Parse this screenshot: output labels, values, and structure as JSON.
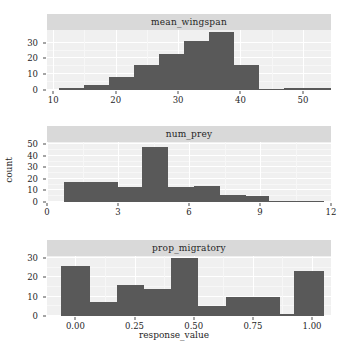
{
  "figure": {
    "xlabel": "response_value",
    "ylabel": "count",
    "bar_color": "#595959",
    "panel_background": "#f0f0f0",
    "strip_background": "#d9d9d9",
    "grid_color": "#ffffff"
  },
  "chart_data": [
    {
      "type": "bar",
      "title": "mean_wingspan",
      "xlabel": "",
      "ylabel": "count",
      "xlim": [
        9.0,
        54.5
      ],
      "ylim": [
        0,
        38
      ],
      "xticks": [
        10,
        20,
        30,
        40,
        50
      ],
      "xticklabels": [
        "10",
        "20",
        "30",
        "40",
        "50"
      ],
      "yticks": [
        0,
        10,
        20,
        30
      ],
      "yticklabels": [
        "0",
        "10",
        "20",
        "30"
      ],
      "grid": true,
      "bin_edges": [
        11.0,
        15.0,
        19.0,
        23.0,
        27.0,
        31.0,
        35.0,
        39.0,
        43.0,
        47.0,
        51.0,
        54.5
      ],
      "values": [
        1,
        3,
        8,
        16,
        23,
        31,
        37,
        16,
        0,
        1,
        1
      ]
    },
    {
      "type": "bar",
      "title": "num_prey",
      "xlabel": "",
      "ylabel": "count",
      "xlim": [
        0,
        12
      ],
      "ylim": [
        0,
        52
      ],
      "xticks": [
        0,
        3,
        6,
        9,
        12
      ],
      "xticklabels": [
        "0",
        "3",
        "6",
        "9",
        "12"
      ],
      "yticks": [
        0,
        10,
        20,
        30,
        40,
        50
      ],
      "yticklabels": [
        "0",
        "10",
        "20",
        "30",
        "40",
        "50"
      ],
      "grid": true,
      "bin_edges": [
        0.7,
        1.85,
        3.0,
        4.0,
        5.1,
        6.2,
        7.3,
        8.4,
        9.4,
        11.7
      ],
      "values": [
        17,
        17,
        13,
        48,
        13,
        14,
        6,
        5,
        1
      ]
    },
    {
      "type": "bar",
      "title": "prop_migratory",
      "xlabel": "response_value",
      "ylabel": "count",
      "xlim": [
        -0.12,
        1.08
      ],
      "ylim": [
        0,
        31
      ],
      "xticks": [
        0.0,
        0.25,
        0.5,
        0.75,
        1.0
      ],
      "xticklabels": [
        "0.00",
        "0.25",
        "0.50",
        "0.75",
        "1.00"
      ],
      "yticks": [
        0,
        10,
        20,
        30
      ],
      "yticklabels": [
        "0",
        "10",
        "20",
        "30"
      ],
      "grid": true,
      "bin_edges": [
        -0.06,
        0.06,
        0.175,
        0.29,
        0.405,
        0.52,
        0.635,
        0.75,
        0.865,
        0.925,
        1.05
      ],
      "values": [
        26,
        7,
        16,
        14,
        30,
        5,
        10,
        10,
        1,
        23
      ]
    }
  ]
}
